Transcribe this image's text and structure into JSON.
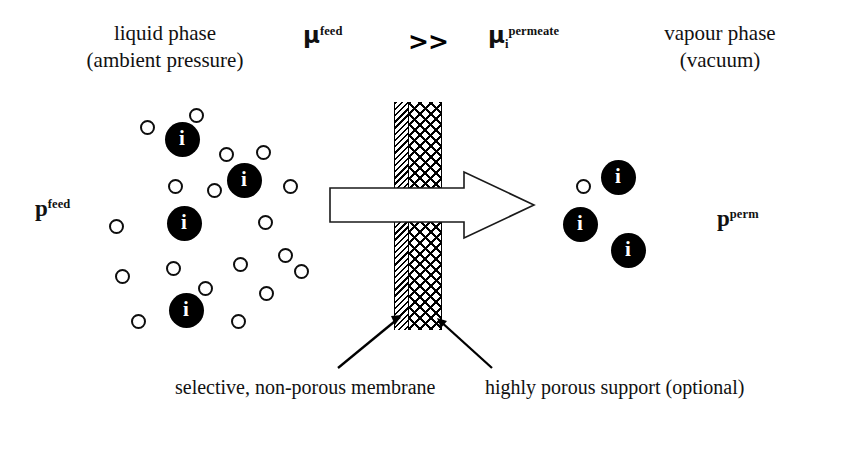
{
  "diagram": {
    "title_implied": "pervaporation membrane separation schematic",
    "headers": {
      "left": {
        "line1": "liquid phase",
        "line2": "(ambient pressure)"
      },
      "right": {
        "line1": "vapour phase",
        "line2": "(vacuum)"
      }
    },
    "driving_force": {
      "feed_potential": {
        "symbol": "μ",
        "superscript": "feed",
        "subscript": ""
      },
      "relation": ">>",
      "permeate_potential": {
        "symbol": "μ",
        "superscript": "permeate",
        "subscript": "i"
      }
    },
    "pressures": {
      "feed": {
        "symbol": "p",
        "superscript": "feed"
      },
      "permeate": {
        "symbol": "p",
        "superscript": "perm"
      }
    },
    "particle_label": "i",
    "captions": {
      "membrane": {
        "line1": "selective, non-porous",
        "line2": "membrane"
      },
      "support": {
        "line1": "highly porous support",
        "line2": "(optional)"
      }
    },
    "colors": {
      "ink": "#000000",
      "background": "#ffffff",
      "particle_solid": "#000000",
      "particle_open_stroke": "#0d0d0d",
      "arrow_fill": "#ffffff",
      "arrow_stroke": "#000000"
    },
    "membrane": {
      "selective_layer": {
        "x": 394,
        "width": 15,
        "y": 102,
        "height": 228,
        "pattern": "diagonal-hatch"
      },
      "support_layer": {
        "x": 409,
        "width": 33,
        "y": 102,
        "height": 228,
        "pattern": "cross-hatch"
      }
    },
    "flux_arrow": {
      "direction": "left-to-right",
      "tail_x": 330,
      "tip_x": 534,
      "center_y": 205
    },
    "feed_particles_open": [
      {
        "x": 147,
        "y": 127
      },
      {
        "x": 196,
        "y": 115
      },
      {
        "x": 263,
        "y": 152
      },
      {
        "x": 226,
        "y": 154
      },
      {
        "x": 290,
        "y": 186
      },
      {
        "x": 175,
        "y": 186
      },
      {
        "x": 214,
        "y": 190
      },
      {
        "x": 116,
        "y": 226
      },
      {
        "x": 265,
        "y": 222
      },
      {
        "x": 173,
        "y": 268
      },
      {
        "x": 240,
        "y": 264
      },
      {
        "x": 285,
        "y": 255
      },
      {
        "x": 122,
        "y": 276
      },
      {
        "x": 205,
        "y": 288
      },
      {
        "x": 138,
        "y": 321
      },
      {
        "x": 266,
        "y": 293
      },
      {
        "x": 301,
        "y": 271
      },
      {
        "x": 238,
        "y": 321
      }
    ],
    "feed_particles_solid": [
      {
        "x": 182,
        "y": 139
      },
      {
        "x": 244,
        "y": 180
      },
      {
        "x": 184,
        "y": 223
      },
      {
        "x": 186,
        "y": 310
      }
    ],
    "permeate_particles_open": [
      {
        "x": 583,
        "y": 186
      }
    ],
    "permeate_particles_solid": [
      {
        "x": 618,
        "y": 177
      },
      {
        "x": 580,
        "y": 224
      },
      {
        "x": 628,
        "y": 250
      }
    ]
  }
}
